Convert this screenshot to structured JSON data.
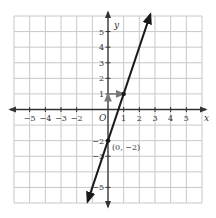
{
  "chart_data": {
    "type": "line",
    "title": "",
    "xlabel": "x",
    "ylabel": "y",
    "xlim": [
      -6,
      6
    ],
    "ylim": [
      -6,
      6
    ],
    "grid": true,
    "origin_label": "O",
    "x_ticks": [
      -5,
      -4,
      -3,
      -2,
      1,
      2,
      3,
      4,
      5
    ],
    "y_ticks": [
      5,
      4,
      3,
      2,
      1,
      -2,
      -3,
      -5
    ],
    "x_tick_labels": [
      "−5",
      "−4",
      "−3",
      "−2",
      "1",
      "2",
      "3",
      "4",
      "5"
    ],
    "y_tick_labels": [
      "5",
      "4",
      "3",
      "2",
      "1",
      "−2",
      "−3",
      "−5"
    ],
    "series": [
      {
        "name": "y = 3x − 2",
        "slope": 3,
        "intercept": -2,
        "x": [
          -1.3,
          2.7
        ],
        "values": [
          -5.9,
          6.1
        ]
      }
    ],
    "points": [
      {
        "x": 0,
        "y": -2,
        "label": "(0, −2)"
      },
      {
        "x": 1,
        "y": 1,
        "label": ""
      }
    ],
    "annotations": [
      {
        "type": "arrow",
        "from": [
          0,
          0.3
        ],
        "to": [
          0,
          1
        ],
        "desc": "rise arrow"
      },
      {
        "type": "arrow",
        "from": [
          0,
          1
        ],
        "to": [
          1,
          1
        ],
        "desc": "run arrow"
      }
    ],
    "colors": {
      "grid": "#c8c8c8",
      "axes": "#333333",
      "line": "#1a1a1a",
      "annotation": "#777777"
    }
  }
}
